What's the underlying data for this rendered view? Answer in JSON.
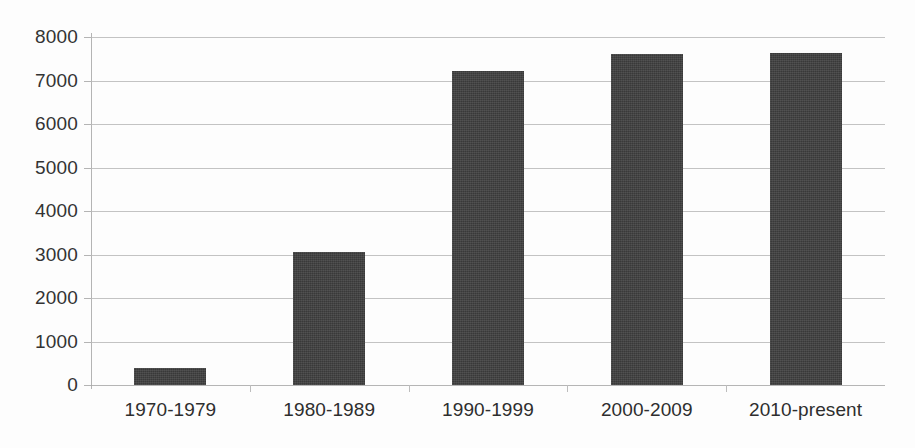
{
  "chart_data": {
    "type": "bar",
    "title": "",
    "subtitle": "",
    "xlabel": "",
    "ylabel": "",
    "categories": [
      "1970-1979",
      "1980-1989",
      "1990-1999",
      "2000-2009",
      "2010-present"
    ],
    "values": [
      390,
      3050,
      7210,
      7600,
      7630
    ],
    "series": [
      {
        "name": "Publications",
        "values": [
          390,
          3050,
          7210,
          7600,
          7630
        ]
      }
    ],
    "ylim": [
      0,
      8000
    ],
    "yticks": [
      0,
      1000,
      2000,
      3000,
      4000,
      5000,
      6000,
      7000,
      8000
    ],
    "ytick_labels": [
      "0",
      "1000",
      "2000",
      "3000",
      "4000",
      "5000",
      "6000",
      "7000",
      "8000"
    ],
    "grid": true,
    "grid_axis": "y",
    "legend": false,
    "legend_position": "none",
    "bar_color": "#3f3f3f",
    "gridline_color": "#b9b9b9",
    "axis_color": "#b4b4b4",
    "background_color": "#ffffff",
    "text_color": "#2e2e2e",
    "annotations": []
  }
}
